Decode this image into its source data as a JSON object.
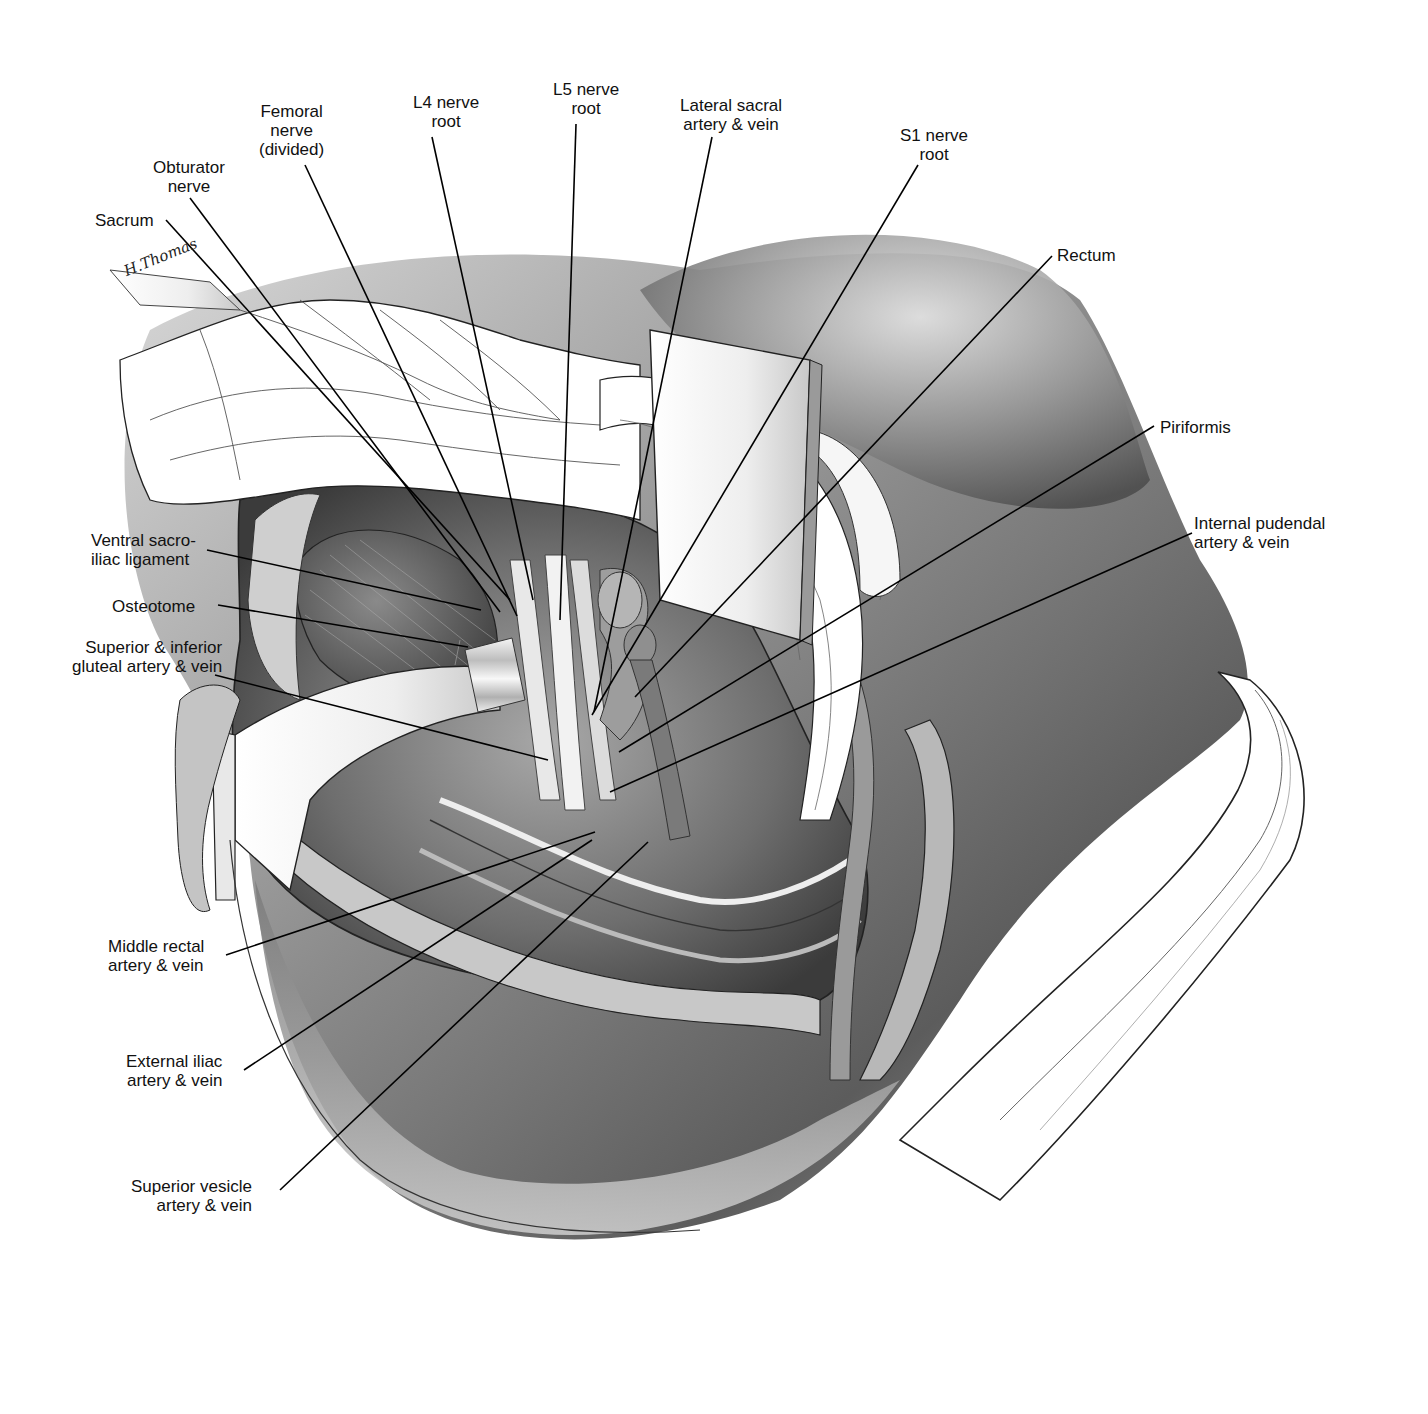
{
  "figure": {
    "artist_signature": "H.Thomas",
    "colors": {
      "background": "#ffffff",
      "ink": "#111111",
      "skin_dark": "#5a5a5a",
      "skin_mid": "#9a9a9a",
      "skin_light": "#d8d8d8",
      "retractor": "#f4f4f4"
    }
  },
  "labels": [
    {
      "id": "sacrum",
      "text": "Sacrum",
      "x": 95,
      "y": 211,
      "align": "left",
      "line": [
        [
          166,
          220
        ],
        [
          510,
          600
        ]
      ]
    },
    {
      "id": "obturator-nerve",
      "text": "Obturator\nnerve",
      "x": 153,
      "y": 158,
      "align": "center",
      "line": [
        [
          190,
          198
        ],
        [
          500,
          612
        ]
      ]
    },
    {
      "id": "femoral-nerve",
      "text": "Femoral\nnerve\n(divided)",
      "x": 259,
      "y": 102,
      "align": "center",
      "line": [
        [
          305,
          165
        ],
        [
          517,
          616
        ]
      ]
    },
    {
      "id": "l4-nerve-root",
      "text": "L4 nerve\nroot",
      "x": 413,
      "y": 93,
      "align": "center",
      "line": [
        [
          432,
          137
        ],
        [
          533,
          600
        ]
      ]
    },
    {
      "id": "l5-nerve-root",
      "text": "L5 nerve\nroot",
      "x": 553,
      "y": 80,
      "align": "center",
      "line": [
        [
          576,
          124
        ],
        [
          560,
          620
        ]
      ]
    },
    {
      "id": "lateral-sacral",
      "text": "Lateral sacral\nartery & vein",
      "x": 680,
      "y": 96,
      "align": "center",
      "line": [
        [
          712,
          137
        ],
        [
          594,
          712
        ]
      ]
    },
    {
      "id": "s1-nerve-root",
      "text": "S1 nerve\nroot",
      "x": 900,
      "y": 126,
      "align": "center",
      "line": [
        [
          918,
          165
        ],
        [
          592,
          715
        ]
      ]
    },
    {
      "id": "rectum",
      "text": "Rectum",
      "x": 1057,
      "y": 246,
      "align": "left",
      "line": [
        [
          1052,
          256
        ],
        [
          635,
          697
        ]
      ]
    },
    {
      "id": "piriformis",
      "text": "Piriformis",
      "x": 1160,
      "y": 418,
      "align": "left",
      "line": [
        [
          1154,
          426
        ],
        [
          619,
          752
        ]
      ]
    },
    {
      "id": "internal-pudendal",
      "text": "Internal pudendal\nartery & vein",
      "x": 1194,
      "y": 514,
      "align": "left",
      "line": [
        [
          1192,
          533
        ],
        [
          610,
          792
        ]
      ]
    },
    {
      "id": "ventral-sacroiliac",
      "text": "Ventral sacro-\niliac ligament",
      "x": 91,
      "y": 531,
      "align": "left",
      "line": [
        [
          207,
          550
        ],
        [
          481,
          610
        ]
      ]
    },
    {
      "id": "osteotome",
      "text": "Osteotome",
      "x": 112,
      "y": 597,
      "align": "left",
      "line": [
        [
          218,
          605
        ],
        [
          468,
          647
        ]
      ]
    },
    {
      "id": "gluteal-vessels",
      "text": "Superior & inferior\ngluteal artery & vein",
      "x": 72,
      "y": 638,
      "align": "right",
      "line": [
        [
          215,
          675
        ],
        [
          548,
          760
        ]
      ]
    },
    {
      "id": "middle-rectal",
      "text": "Middle rectal\nartery & vein",
      "x": 108,
      "y": 937,
      "align": "left",
      "line": [
        [
          226,
          955
        ],
        [
          595,
          832
        ]
      ]
    },
    {
      "id": "external-iliac",
      "text": "External iliac\nartery & vein",
      "x": 126,
      "y": 1052,
      "align": "left",
      "line": [
        [
          244,
          1070
        ],
        [
          592,
          840
        ]
      ]
    },
    {
      "id": "superior-vesicle",
      "text": "Superior vesicle\nartery & vein",
      "x": 131,
      "y": 1177,
      "align": "left",
      "line": [
        [
          280,
          1190
        ],
        [
          648,
          842
        ]
      ]
    }
  ]
}
